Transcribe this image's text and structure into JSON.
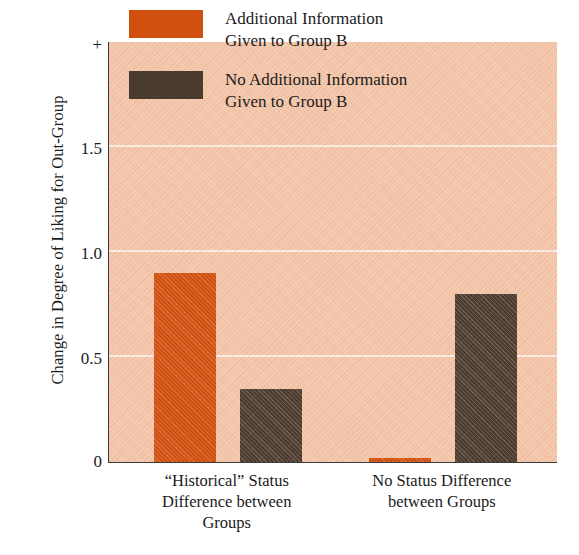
{
  "chart_data": {
    "type": "bar",
    "title": "",
    "xlabel": "",
    "ylabel": "Change in Degree of Liking for Out-Group",
    "categories": [
      "“Historical” Status\nDifference between\nGroups",
      "No Status Difference\nbetween Groups"
    ],
    "series": [
      {
        "name": "Additional Information\nGiven to Group B",
        "color": "#d2500f",
        "values": [
          0.9,
          0.02
        ]
      },
      {
        "name": "No Additional Information\nGiven to Group B",
        "color": "#4b3a2e",
        "values": [
          0.35,
          0.8
        ]
      }
    ],
    "ylim": [
      0,
      2.0
    ],
    "yticks": [
      "0",
      "0.5",
      "1.0",
      "1.5",
      "+"
    ],
    "ytick_values": [
      0,
      0.5,
      1.0,
      1.5,
      2.0
    ],
    "grid": true,
    "gridlines_at": [
      0.5,
      1.0,
      1.5
    ],
    "legend_position": "top-center",
    "plot_background": "#f3c4a8"
  },
  "legend": {
    "entries": [
      {
        "label": "Additional Information\nGiven to Group B",
        "swatch": "#d2500f"
      },
      {
        "label": "No Additional Information\nGiven to Group B",
        "swatch": "#4b3a2e"
      }
    ]
  },
  "axis": {
    "y_title": "Change in Degree of Liking for Out-Group",
    "y_tick_top": "+",
    "y_tick_1_5": "1.5",
    "y_tick_1_0": "1.0",
    "y_tick_0_5": "0.5",
    "y_tick_0": "0"
  }
}
